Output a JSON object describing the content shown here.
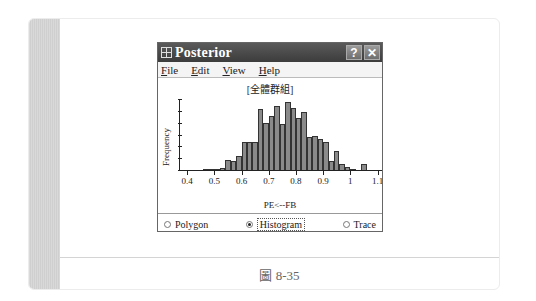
{
  "window": {
    "title": "Posterior",
    "help_button": "?",
    "close_button": "✕",
    "menu": [
      {
        "label": "File",
        "accel": "F"
      },
      {
        "label": "Edit",
        "accel": "E"
      },
      {
        "label": "View",
        "accel": "V"
      },
      {
        "label": "Help",
        "accel": "H"
      }
    ],
    "radio_options": [
      {
        "label": "Polygon",
        "selected": false
      },
      {
        "label": "Histogram",
        "selected": true
      },
      {
        "label": "Trace",
        "selected": false
      }
    ]
  },
  "caption": "圖 8-35",
  "chart_data": {
    "type": "bar",
    "title": "[全體群組]",
    "xlabel": "PE<--FB",
    "ylabel": "Frequency",
    "x_ticks": [
      "0.4",
      "0.5",
      "0.6",
      "0.7",
      "0.8",
      "0.9",
      "1",
      "1.1"
    ],
    "xlim": [
      0.37,
      1.12
    ],
    "bin_width": 0.02,
    "categories": [
      0.47,
      0.49,
      0.51,
      0.53,
      0.55,
      0.57,
      0.59,
      0.61,
      0.63,
      0.65,
      0.67,
      0.69,
      0.71,
      0.73,
      0.75,
      0.77,
      0.79,
      0.81,
      0.83,
      0.85,
      0.87,
      0.89,
      0.91,
      0.93,
      0.95,
      0.97,
      0.99,
      1.01,
      1.03,
      1.05
    ],
    "values": [
      1,
      1,
      2,
      3,
      14,
      13,
      20,
      40,
      40,
      41,
      88,
      68,
      79,
      93,
      67,
      98,
      90,
      75,
      84,
      48,
      50,
      45,
      41,
      13,
      27,
      9,
      5,
      2,
      0,
      8
    ],
    "y_ticks_count": 6,
    "grid": false
  }
}
